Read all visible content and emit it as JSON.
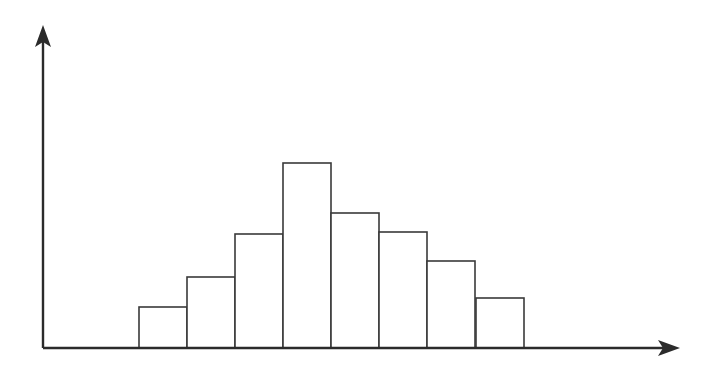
{
  "figure": {
    "kind": "hand-drawn-histogram",
    "background_color": "#ffffff",
    "ink_color": "#2b2b2b",
    "bar_stroke_color": "#3a3a3a",
    "bar_fill_color": "#ffffff",
    "title": "",
    "caption": ""
  },
  "axes": {
    "y_axis": {
      "name": "y-axis",
      "label": "",
      "has_arrowhead": true,
      "arrow_direction": "up",
      "origin_px": {
        "x": 43,
        "y": 348
      },
      "tip_px": {
        "x": 43,
        "y": 27
      },
      "tick_labels": []
    },
    "x_axis": {
      "name": "x-axis",
      "label": "",
      "has_arrowhead": true,
      "arrow_direction": "right",
      "origin_px": {
        "x": 43,
        "y": 348
      },
      "tip_px": {
        "x": 678,
        "y": 348
      },
      "tick_labels": []
    },
    "baseline_y_px": 348,
    "grid": false,
    "legend": null
  },
  "chart_data": {
    "type": "bar",
    "title": "",
    "subtitle": "",
    "xlabel": "",
    "ylabel": "",
    "grid": false,
    "legend": null,
    "legend_position": "none",
    "bar_count": 8,
    "contiguous_bars": true,
    "categories": [
      "1",
      "2",
      "3",
      "4",
      "5",
      "6",
      "7",
      "8"
    ],
    "values": [
      2,
      3,
      5,
      8,
      6,
      5,
      4,
      2
    ],
    "ylim": [
      0,
      9
    ],
    "xlim": [
      0,
      8
    ],
    "pixel_geometry": {
      "bar_left_px": [
        139,
        187,
        235,
        283,
        331,
        379,
        427,
        476
      ],
      "bar_width_px": 48,
      "bar_top_px": [
        307,
        277,
        234,
        163,
        213,
        232,
        261,
        298
      ],
      "bar_height_px": [
        41,
        71,
        114,
        185,
        135,
        116,
        87,
        50
      ],
      "bars_start_px": 139,
      "bars_end_px": 524
    },
    "annotations": [],
    "shape_description": "unimodal roughly bell-shaped distribution peaking at the fourth bar"
  }
}
